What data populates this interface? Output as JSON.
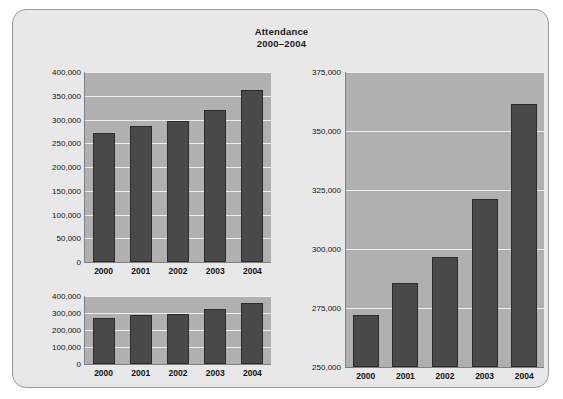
{
  "title": {
    "line1": "Attendance",
    "line2": "2000–2004"
  },
  "colors": {
    "panel_background": "#e8e8e8",
    "panel_border": "#9a9a9a",
    "plot_background": "#b0b0b0",
    "gridline": "#efefef",
    "bar_fill": "#494949",
    "bar_outline": "#2b2b2b",
    "text": "#111111"
  },
  "chart_data": [
    {
      "id": "top-left-chart",
      "type": "bar",
      "title": "Attendance 2000–2004",
      "xlabel": "",
      "ylabel": "",
      "categories": [
        "2000",
        "2001",
        "2002",
        "2003",
        "2004"
      ],
      "values": [
        272000,
        285500,
        296500,
        321000,
        361500
      ],
      "ylim": [
        0,
        400000
      ],
      "yticks": [
        0,
        50000,
        100000,
        150000,
        200000,
        250000,
        300000,
        350000,
        400000
      ],
      "ytick_labels": [
        "0",
        "50,000",
        "100,000",
        "150,000",
        "200,000",
        "250,000",
        "300,000",
        "350,000",
        "400,000"
      ],
      "grid": true,
      "legend": "none"
    },
    {
      "id": "bottom-left-chart",
      "type": "bar",
      "title": "Attendance 2000–2004",
      "xlabel": "",
      "ylabel": "",
      "categories": [
        "2000",
        "2001",
        "2002",
        "2003",
        "2004"
      ],
      "values": [
        272000,
        285500,
        296500,
        321000,
        361500
      ],
      "ylim": [
        0,
        400000
      ],
      "yticks": [
        0,
        100000,
        200000,
        300000,
        400000
      ],
      "ytick_labels": [
        "0",
        "100,000",
        "200,000",
        "300,000",
        "400,000"
      ],
      "grid": true,
      "legend": "none"
    },
    {
      "id": "right-chart",
      "type": "bar",
      "title": "Attendance 2000–2004",
      "xlabel": "",
      "ylabel": "",
      "categories": [
        "2000",
        "2001",
        "2002",
        "2003",
        "2004"
      ],
      "values": [
        272000,
        285500,
        296500,
        321000,
        361500
      ],
      "ylim": [
        250000,
        375000
      ],
      "yticks": [
        250000,
        275000,
        300000,
        325000,
        350000,
        375000
      ],
      "ytick_labels": [
        "250,000",
        "275,000",
        "300,000",
        "325,000",
        "350,000",
        "375,000"
      ],
      "grid": true,
      "legend": "none"
    }
  ]
}
